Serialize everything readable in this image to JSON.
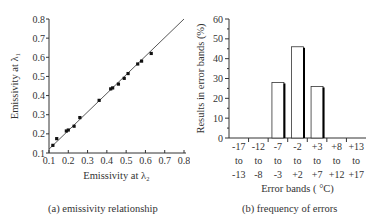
{
  "chart_data": [
    {
      "type": "scatter",
      "title": "",
      "caption": "(a) emissivity relationship",
      "xlabel": "Emissivity at λ₂",
      "ylabel": "Emissivity at λ₁",
      "xlim": [
        0.1,
        0.8
      ],
      "ylim": [
        0.1,
        0.8
      ],
      "xticks": [
        "0.1",
        "0.2",
        "0.3",
        "0.4",
        "0.5",
        "0.6",
        "0.7",
        "0.8"
      ],
      "yticks": [
        "0.1",
        "0.2",
        "0.3",
        "0.4",
        "0.5",
        "0.6",
        "0.7",
        "0.8"
      ],
      "grid": false,
      "legend": null,
      "points": [
        {
          "x": 0.12,
          "y": 0.14
        },
        {
          "x": 0.14,
          "y": 0.175
        },
        {
          "x": 0.19,
          "y": 0.215
        },
        {
          "x": 0.2,
          "y": 0.22
        },
        {
          "x": 0.23,
          "y": 0.24
        },
        {
          "x": 0.26,
          "y": 0.285
        },
        {
          "x": 0.36,
          "y": 0.375
        },
        {
          "x": 0.42,
          "y": 0.435
        },
        {
          "x": 0.43,
          "y": 0.44
        },
        {
          "x": 0.46,
          "y": 0.46
        },
        {
          "x": 0.49,
          "y": 0.49
        },
        {
          "x": 0.51,
          "y": 0.515
        },
        {
          "x": 0.56,
          "y": 0.565
        },
        {
          "x": 0.58,
          "y": 0.58
        },
        {
          "x": 0.63,
          "y": 0.62
        }
      ],
      "fit_line": {
        "x": [
          0.1,
          0.8
        ],
        "y": [
          0.12,
          0.8
        ]
      }
    },
    {
      "type": "bar",
      "title": "",
      "caption": "(b) frequency of errors",
      "xlabel": "Error bands ( °C)",
      "ylabel": "Results in error bands (%)",
      "ylim": [
        0,
        60
      ],
      "yticks": [
        "0",
        "10",
        "20",
        "30",
        "40",
        "50",
        "60"
      ],
      "grid": false,
      "legend": null,
      "categories": [
        {
          "top": "-17",
          "mid": "to",
          "bottom": "-13"
        },
        {
          "top": "-12",
          "mid": "to",
          "bottom": "-8"
        },
        {
          "top": "-7",
          "mid": "to",
          "bottom": "-3"
        },
        {
          "top": "-2",
          "mid": "to",
          "bottom": "+2"
        },
        {
          "top": "+3",
          "mid": "to",
          "bottom": "+7"
        },
        {
          "top": "+8",
          "mid": "to",
          "bottom": "+12"
        },
        {
          "top": "+13",
          "mid": "to",
          "bottom": "+17"
        }
      ],
      "values": [
        0,
        0,
        28,
        46,
        26,
        0,
        0
      ]
    }
  ],
  "captions": {
    "a": "(a) emissivity relationship",
    "b": "(b) frequency of errors"
  }
}
